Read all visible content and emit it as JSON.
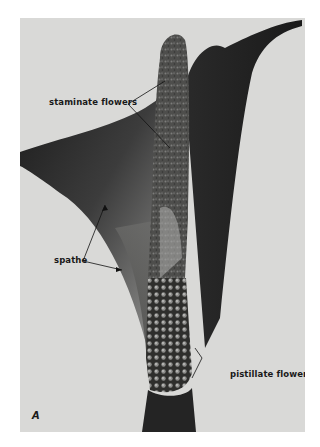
{
  "figure": {
    "panel_letter": "A",
    "colors": {
      "background": "#d9d9d7",
      "spathe_dark": "#2b2b2b",
      "spathe_light": "#8a8a88",
      "spadix": "#4a4a48",
      "page": "#ffffff"
    },
    "labels": [
      {
        "id": "staminate",
        "text": "staminate flowers"
      },
      {
        "id": "spathe",
        "text": "spathe"
      },
      {
        "id": "pistillate",
        "text": "pistillate flowers"
      }
    ]
  }
}
